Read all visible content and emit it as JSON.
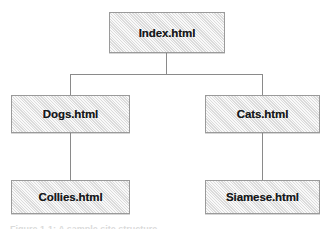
{
  "diagram": {
    "type": "tree",
    "colors": {
      "box_fill": "#e9e9e9",
      "box_border": "#9a9a9a",
      "connector": "#8a8a8a",
      "label_text": "#16181a",
      "background": "#ffffff"
    },
    "nodes": [
      {
        "id": "index",
        "label": "Index.html",
        "level": 0
      },
      {
        "id": "dogs",
        "label": "Dogs.html",
        "level": 1
      },
      {
        "id": "cats",
        "label": "Cats.html",
        "level": 1
      },
      {
        "id": "collies",
        "label": "Collies.html",
        "level": 2
      },
      {
        "id": "siamese",
        "label": "Siamese.html",
        "level": 2
      }
    ],
    "edges": [
      {
        "from": "index",
        "to": "dogs"
      },
      {
        "from": "index",
        "to": "cats"
      },
      {
        "from": "dogs",
        "to": "collies"
      },
      {
        "from": "cats",
        "to": "siamese"
      }
    ]
  },
  "caption": {
    "text": "Figure 1-1: A sample site structure"
  }
}
